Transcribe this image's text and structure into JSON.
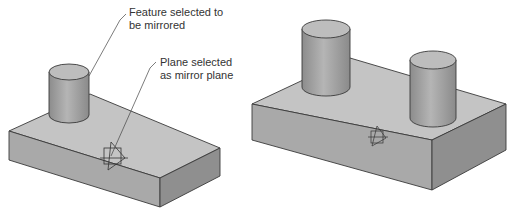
{
  "diagram": {
    "before": {
      "callouts": [
        {
          "id": "feature",
          "line1": "Feature selected to",
          "line2": "be mirrored"
        },
        {
          "id": "plane",
          "line1": "Plane selected",
          "line2": "as mirror plane"
        }
      ]
    },
    "after": {
      "description": "Result with mirrored cylinder"
    },
    "colors": {
      "background": "#ffffff",
      "top_face": "#c4c4c4",
      "front_face": "#a9a9a9",
      "side_face": "#8f8f8f",
      "edge": "#3a3a3a",
      "text": "#333333"
    }
  }
}
